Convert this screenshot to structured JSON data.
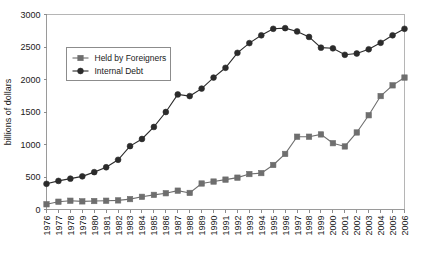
{
  "chart_data": {
    "type": "line",
    "title": "",
    "xlabel": "",
    "ylabel": "billions of dollars",
    "ylim": [
      0,
      3000
    ],
    "yticks": [
      0,
      500,
      1000,
      1500,
      2000,
      2500,
      3000
    ],
    "ytick_labels": [
      "0",
      "500",
      "1000",
      "1500",
      "2000",
      "2500",
      "3000"
    ],
    "grid": false,
    "legend_position": "upper-left",
    "categories": [
      "1976",
      "1977",
      "1978",
      "1979",
      "1980",
      "1981",
      "1982",
      "1983",
      "1984",
      "1985",
      "1986",
      "1987",
      "1988",
      "1989",
      "1990",
      "1991",
      "1992",
      "1993",
      "1994",
      "1995",
      "1996",
      "1997",
      "1998",
      "1999",
      "2000",
      "2001",
      "2002",
      "2003",
      "2004",
      "2005",
      "2006"
    ],
    "series": [
      {
        "name": "Held by Foreigners",
        "color": "#6e6e6e",
        "marker": "square",
        "values": [
          80,
          120,
          135,
          125,
          130,
          135,
          140,
          160,
          195,
          225,
          250,
          290,
          255,
          400,
          430,
          460,
          490,
          545,
          560,
          685,
          855,
          1120,
          1120,
          1155,
          1020,
          970,
          1185,
          1450,
          1745,
          1910,
          2030
        ]
      },
      {
        "name": "Internal Debt",
        "color": "#2b2b2b",
        "marker": "circle",
        "values": [
          395,
          440,
          475,
          510,
          575,
          650,
          765,
          975,
          1085,
          1270,
          1500,
          1770,
          1745,
          1860,
          2030,
          2180,
          2410,
          2560,
          2680,
          2780,
          2790,
          2740,
          2655,
          2490,
          2480,
          2380,
          2400,
          2465,
          2565,
          2680,
          2780
        ]
      }
    ]
  },
  "axis": {
    "y_axis_title": "billions of dollars"
  },
  "legend": {
    "entries": [
      {
        "label": "Held by Foreigners"
      },
      {
        "label": "Internal Debt"
      }
    ]
  }
}
